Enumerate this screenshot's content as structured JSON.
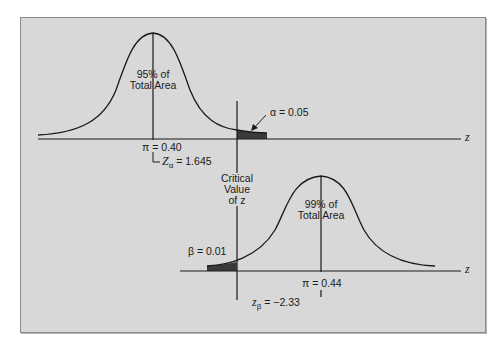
{
  "diagram": {
    "type": "hypothesis-test-distributions",
    "colors": {
      "background": "#d8d8d8",
      "curve": "#1a1a1a",
      "shaded_area": "#3a3a3a",
      "page": "#ffffff"
    },
    "top_distribution": {
      "center_label": "π = 0.40",
      "area_label_line1": "95% of",
      "area_label_line2": "Total Area",
      "z_critical_label_prefix": "Z",
      "z_critical_subscript": "α",
      "z_critical_value": " = 1.645",
      "tail_label": "α = 0.05",
      "axis_label": "z"
    },
    "critical_value": {
      "line1": "Critical",
      "line2": "Value",
      "line3": "of z"
    },
    "bottom_distribution": {
      "center_label": "π = 0.44",
      "area_label_line1": "99% of",
      "area_label_line2": "Total Area",
      "z_beta_prefix": "z",
      "z_beta_subscript": "β",
      "z_beta_value": " = −2.33",
      "tail_label": "β = 0.01",
      "axis_label": "z"
    }
  }
}
